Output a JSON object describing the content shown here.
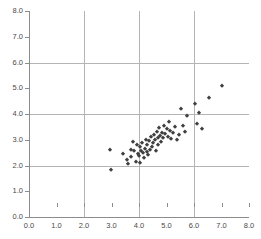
{
  "captions": {
    "top": "",
    "bottom": ""
  },
  "chart_data": {
    "type": "scatter",
    "title": "",
    "xlabel": "",
    "ylabel": "",
    "xlim": [
      0.0,
      8.0
    ],
    "ylim": [
      0.0,
      8.0
    ],
    "grid": true,
    "legend": null,
    "marker": "diamond",
    "marker_color": "#3f3f3f",
    "xticks": [
      "0.0",
      "1.0",
      "2.0",
      "3.0",
      "4.0",
      "5.0",
      "6.0",
      "7.0",
      "8.0"
    ],
    "yticks": [
      "0.0",
      "1.0",
      "2.0",
      "3.0",
      "4.0",
      "5.0",
      "6.0",
      "7.0",
      "8.0"
    ],
    "xtick_values": [
      0,
      1,
      2,
      3,
      4,
      5,
      6,
      7,
      8
    ],
    "ytick_values": [
      0,
      1,
      2,
      3,
      4,
      5,
      6,
      7,
      8
    ],
    "gridline_x_values": [
      2,
      4,
      6
    ],
    "gridline_y_values": [
      2,
      4,
      6
    ],
    "points": [
      [
        2.95,
        2.6
      ],
      [
        2.98,
        1.82
      ],
      [
        3.42,
        2.46
      ],
      [
        3.55,
        2.22
      ],
      [
        3.6,
        2.05
      ],
      [
        3.7,
        2.62
      ],
      [
        3.72,
        2.33
      ],
      [
        3.78,
        2.92
      ],
      [
        3.82,
        2.55
      ],
      [
        3.88,
        2.15
      ],
      [
        3.92,
        2.78
      ],
      [
        3.95,
        2.44
      ],
      [
        4.0,
        2.35
      ],
      [
        4.02,
        2.7
      ],
      [
        4.05,
        2.08
      ],
      [
        4.08,
        2.58
      ],
      [
        4.12,
        2.88
      ],
      [
        4.15,
        2.48
      ],
      [
        4.18,
        2.3
      ],
      [
        4.2,
        2.66
      ],
      [
        4.24,
        3.0
      ],
      [
        4.28,
        2.52
      ],
      [
        4.3,
        2.78
      ],
      [
        4.34,
        2.4
      ],
      [
        4.38,
        2.95
      ],
      [
        4.4,
        2.62
      ],
      [
        4.44,
        3.1
      ],
      [
        4.48,
        2.72
      ],
      [
        4.5,
        2.88
      ],
      [
        4.54,
        3.2
      ],
      [
        4.58,
        2.98
      ],
      [
        4.6,
        2.55
      ],
      [
        4.64,
        3.32
      ],
      [
        4.68,
        3.05
      ],
      [
        4.7,
        2.8
      ],
      [
        4.74,
        3.45
      ],
      [
        4.78,
        3.15
      ],
      [
        4.8,
        2.92
      ],
      [
        4.84,
        3.28
      ],
      [
        4.88,
        3.08
      ],
      [
        4.92,
        3.55
      ],
      [
        4.95,
        3.22
      ],
      [
        5.0,
        3.42
      ],
      [
        5.05,
        3.12
      ],
      [
        5.08,
        3.7
      ],
      [
        5.12,
        3.35
      ],
      [
        5.18,
        3.02
      ],
      [
        5.22,
        3.25
      ],
      [
        5.3,
        3.48
      ],
      [
        5.38,
        2.98
      ],
      [
        5.45,
        3.18
      ],
      [
        5.52,
        4.2
      ],
      [
        5.6,
        3.55
      ],
      [
        5.68,
        3.3
      ],
      [
        5.75,
        3.92
      ],
      [
        6.05,
        4.38
      ],
      [
        6.12,
        3.62
      ],
      [
        6.18,
        4.05
      ],
      [
        6.3,
        3.42
      ],
      [
        6.55,
        4.62
      ],
      [
        7.0,
        5.1
      ]
    ]
  }
}
